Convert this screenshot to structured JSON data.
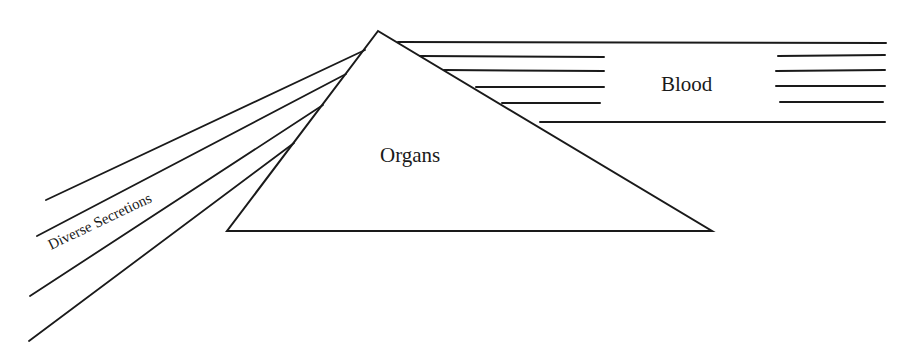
{
  "diagram": {
    "type": "schematic",
    "labels": {
      "organs": "Organs",
      "blood": "Blood",
      "secretions": "Diverse Secretions"
    },
    "colors": {
      "ink": "#1a1a1a",
      "background": "#ffffff"
    },
    "shapes": {
      "organ_triangle": {
        "apex": [
          378,
          31
        ],
        "bottom_left": [
          227,
          231
        ],
        "bottom_right": [
          712,
          231
        ]
      },
      "secretion_lines": [
        {
          "from": [
            365,
            50
          ],
          "to": [
            46,
            200
          ]
        },
        {
          "from": [
            346,
            74
          ],
          "to": [
            37,
            236
          ]
        },
        {
          "from": [
            323,
            105
          ],
          "to": [
            30,
            296
          ]
        },
        {
          "from": [
            294,
            143
          ],
          "to": [
            29,
            341
          ]
        }
      ],
      "blood_top_line": {
        "from": [
          398,
          42
        ],
        "to": [
          886,
          43
        ]
      },
      "blood_left_stubs": [
        {
          "from": [
            420,
            56
          ],
          "to": [
            604,
            57
          ]
        },
        {
          "from": [
            444,
            70
          ],
          "to": [
            604,
            71
          ]
        },
        {
          "from": [
            476,
            87
          ],
          "to": [
            604,
            87
          ]
        },
        {
          "from": [
            502,
            103
          ],
          "to": [
            600,
            103
          ]
        }
      ],
      "blood_bottom_line": {
        "from": [
          540,
          122
        ],
        "to": [
          885,
          122
        ]
      },
      "blood_right_stubs": [
        {
          "from": [
            778,
            56
          ],
          "to": [
            885,
            55
          ]
        },
        {
          "from": [
            776,
            71
          ],
          "to": [
            885,
            70
          ]
        },
        {
          "from": [
            776,
            86
          ],
          "to": [
            885,
            86
          ]
        },
        {
          "from": [
            780,
            102
          ],
          "to": [
            883,
            102
          ]
        }
      ]
    }
  }
}
